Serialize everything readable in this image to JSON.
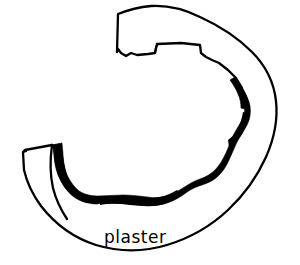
{
  "figure": {
    "kind": "line-drawing",
    "background_color": "#ffffff",
    "ink_color": "#000000",
    "width": 300,
    "height": 265
  },
  "caption": {
    "label": "plaster",
    "color": "#000000",
    "x": 104,
    "y": 243
  },
  "layers": [
    {
      "name": "outer-contour",
      "description": "thin outline of vessel wall, open at upper left and left end",
      "stroke_color": "#000000",
      "stroke_width": 2.2,
      "fill": "none"
    },
    {
      "name": "inner-contour",
      "description": "thin stepped and notched inner edge of vessel wall",
      "stroke_color": "#000000",
      "stroke_width": 2.2,
      "fill": "none"
    },
    {
      "name": "plaster-band",
      "description": "thick solid black irregular band lining the inner surface along the right side and bottom",
      "fill_color": "#000000"
    }
  ],
  "annotations": {
    "plaster_band_label": "plaster",
    "open_end_position": "left",
    "band_extent": "upper-right to lower-left"
  }
}
